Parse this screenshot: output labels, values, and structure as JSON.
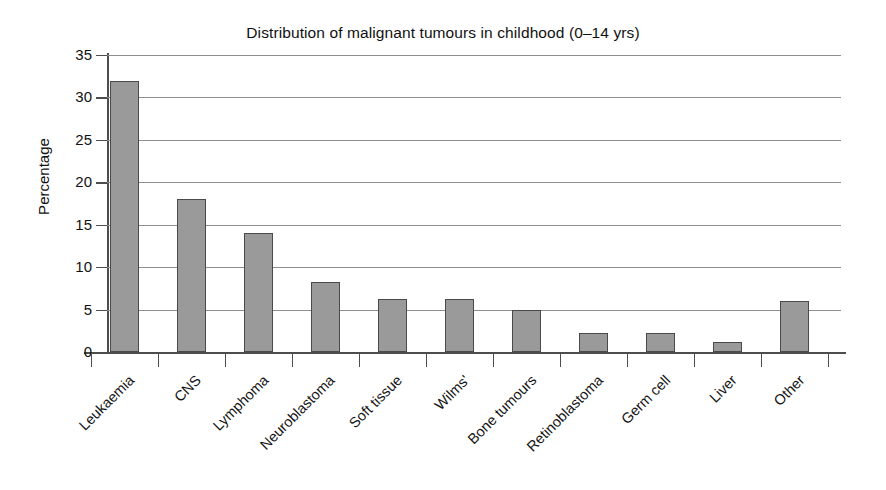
{
  "chart_data": {
    "type": "bar",
    "title": "Distribution of malignant tumours in childhood (0–14 yrs)",
    "xlabel": "",
    "ylabel": "Percentage",
    "ylim": [
      0,
      35
    ],
    "ytick_step": 5,
    "yticks": [
      "0",
      "5",
      "10",
      "15",
      "20",
      "25",
      "30",
      "35"
    ],
    "grid": true,
    "legend": "none",
    "bar_color": "#9a9a9a",
    "bar_edge_color": "#4a4a4a",
    "axis_color": "#4d4d4d",
    "categories": [
      "Leukaemia",
      "CNS",
      "Lymphoma",
      "Neuroblastoma",
      "Soft tissue",
      "Wilms'",
      "Bone tumours",
      "Retinoblastoma",
      "Germ cell",
      "Liver",
      "Other"
    ],
    "values": [
      32,
      18,
      14,
      8.2,
      6.2,
      6.2,
      5,
      2.2,
      2.2,
      1.2,
      6
    ]
  }
}
